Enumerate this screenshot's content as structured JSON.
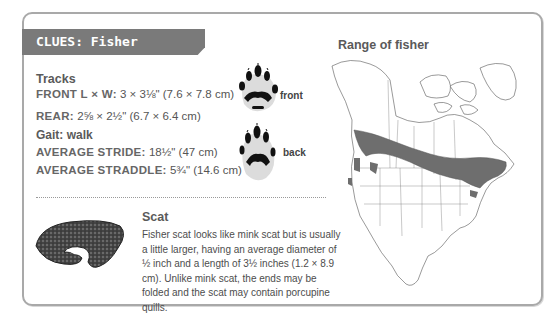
{
  "header": {
    "title": "CLUES: Fisher"
  },
  "tracks": {
    "heading": "Tracks",
    "front_label": "FRONT L × W:",
    "front_value": "3 × 3⅛\" (7.6 × 7.8 cm)",
    "rear_label": "REAR:",
    "rear_value": "2⅝ × 2½\" (6.7 × 6.4 cm)",
    "gait": "Gait: walk",
    "stride_label": "AVERAGE STRIDE:",
    "stride_value": "18½\" (47 cm)",
    "straddle_label": "AVERAGE STRADDLE:",
    "straddle_value": "5¾\" (14.6 cm)",
    "front_print_label": "front",
    "back_print_label": "back"
  },
  "scat": {
    "heading": "Scat",
    "description": "Fisher scat looks like mink scat but is usually a little larger, having an average diameter of ½ inch and a length of 3½ inches (1.2 × 8.9 cm). Unlike mink scat, the ends may be folded and the scat may contain porcupine quills."
  },
  "map": {
    "title": "Range of fisher",
    "range_color": "#6e6e6e",
    "outline_color": "#555555"
  },
  "colors": {
    "band": "#7a7a7a",
    "border": "#a9a9a9",
    "text": "#555555"
  }
}
